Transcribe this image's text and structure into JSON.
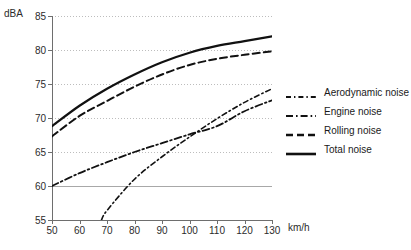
{
  "chart_data": {
    "type": "line",
    "title": "",
    "xlabel": "km/h",
    "ylabel": "dBA",
    "xlim": [
      50,
      130
    ],
    "ylim": [
      55,
      85
    ],
    "xticks": [
      50,
      60,
      70,
      80,
      90,
      100,
      110,
      120,
      130
    ],
    "yticks": [
      55,
      60,
      65,
      70,
      75,
      80,
      85
    ],
    "grid": "horizontal-dotted",
    "legend_position": "right",
    "x": [
      50,
      60,
      70,
      80,
      90,
      100,
      110,
      120,
      130
    ],
    "series": [
      {
        "name": "Aerodynamic noise",
        "style": "dash-dot-fine",
        "x": [
          68,
          70,
          80,
          90,
          100,
          110,
          120,
          130
        ],
        "values": [
          55.0,
          56.4,
          61.0,
          64.3,
          67.2,
          69.9,
          72.3,
          74.3
        ]
      },
      {
        "name": "Engine noise",
        "style": "dash-dot",
        "x": [
          50,
          60,
          70,
          80,
          90,
          100,
          110,
          120,
          130
        ],
        "values": [
          60.0,
          61.9,
          63.5,
          65.0,
          66.3,
          67.6,
          68.8,
          71.0,
          72.6
        ]
      },
      {
        "name": "Rolling noise",
        "style": "dashed",
        "x": [
          50,
          60,
          70,
          80,
          90,
          100,
          110,
          120,
          130
        ],
        "values": [
          67.3,
          70.3,
          72.5,
          74.6,
          76.4,
          77.8,
          78.7,
          79.3,
          79.8
        ]
      },
      {
        "name": "Total noise",
        "style": "solid",
        "x": [
          50,
          60,
          70,
          80,
          90,
          100,
          110,
          120,
          130
        ],
        "values": [
          68.8,
          71.8,
          74.3,
          76.4,
          78.2,
          79.6,
          80.6,
          81.3,
          82.0
        ]
      }
    ]
  },
  "legend": {
    "items": [
      {
        "label": "Aerodynamic noise"
      },
      {
        "label": "Engine noise"
      },
      {
        "label": "Rolling noise"
      },
      {
        "label": "Total noise"
      }
    ]
  }
}
